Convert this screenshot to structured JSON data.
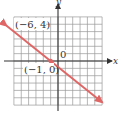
{
  "chart_data": {
    "type": "line",
    "title": "",
    "xlabel": "x",
    "ylabel": "y",
    "xlim": [
      -6,
      6
    ],
    "ylim": [
      -6,
      6
    ],
    "grid": true,
    "origin_label": "0",
    "series": [
      {
        "name": "line",
        "color": "#e06666",
        "x": [
          -7,
          -6,
          -1,
          6
        ],
        "y": [
          4.8,
          4,
          0,
          -5.6
        ],
        "arrows": "both"
      }
    ],
    "points": [
      {
        "x": -6,
        "y": 4,
        "label": "(−6, 4)"
      },
      {
        "x": -1,
        "y": 0,
        "label": "(−1, 0)"
      }
    ]
  },
  "labels": {
    "x_axis": "x",
    "y_axis": "y",
    "origin": "0",
    "point_a": "(−6, 4)",
    "point_b": "(−1, 0)"
  }
}
